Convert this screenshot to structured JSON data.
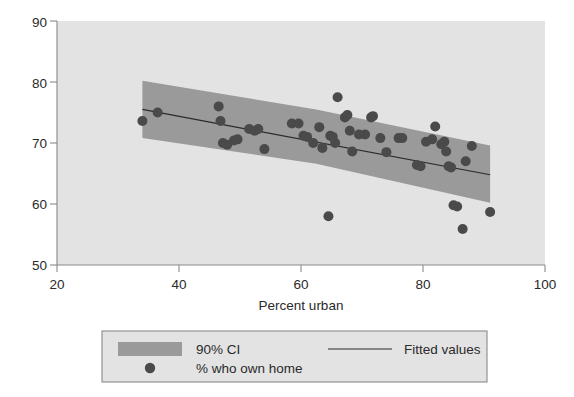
{
  "chart_data": {
    "type": "scatter",
    "title": "",
    "xlabel": "Percent urban",
    "ylabel": "",
    "xlim": [
      20,
      100
    ],
    "ylim": [
      50,
      90
    ],
    "xticks": [
      20,
      40,
      60,
      80,
      100
    ],
    "yticks": [
      50,
      60,
      70,
      80,
      90
    ],
    "grid": false,
    "plot_background": "#e3e3e3",
    "legend_position": "bottom-outside",
    "series": [
      {
        "name": "% who own home",
        "type": "scatter",
        "marker": "circle",
        "color": "#4a4a4a",
        "points": [
          [
            34.0,
            73.6
          ],
          [
            36.5,
            75.0
          ],
          [
            46.5,
            76.0
          ],
          [
            46.8,
            73.6
          ],
          [
            47.2,
            70.0
          ],
          [
            47.9,
            69.7
          ],
          [
            49.0,
            70.4
          ],
          [
            49.6,
            70.6
          ],
          [
            51.5,
            72.3
          ],
          [
            52.4,
            72.0
          ],
          [
            53.0,
            72.3
          ],
          [
            54.0,
            69.0
          ],
          [
            58.5,
            73.2
          ],
          [
            59.6,
            73.2
          ],
          [
            60.4,
            71.2
          ],
          [
            61.0,
            71.0
          ],
          [
            62.0,
            70.0
          ],
          [
            63.0,
            72.6
          ],
          [
            63.5,
            69.2
          ],
          [
            64.5,
            58.0
          ],
          [
            64.8,
            71.2
          ],
          [
            65.2,
            71.0
          ],
          [
            65.6,
            70.0
          ],
          [
            66.0,
            77.5
          ],
          [
            67.2,
            74.2
          ],
          [
            67.6,
            74.6
          ],
          [
            68.0,
            72.0
          ],
          [
            68.4,
            68.6
          ],
          [
            69.5,
            71.4
          ],
          [
            70.5,
            71.4
          ],
          [
            71.5,
            74.2
          ],
          [
            71.8,
            74.4
          ],
          [
            73.0,
            70.8
          ],
          [
            74.0,
            68.5
          ],
          [
            76.0,
            70.8
          ],
          [
            76.6,
            70.8
          ],
          [
            79.0,
            66.4
          ],
          [
            79.6,
            66.2
          ],
          [
            80.5,
            70.2
          ],
          [
            81.5,
            70.6
          ],
          [
            82.0,
            72.7
          ],
          [
            83.0,
            69.8
          ],
          [
            83.5,
            70.2
          ],
          [
            83.8,
            68.6
          ],
          [
            84.2,
            66.2
          ],
          [
            84.6,
            66.0
          ],
          [
            85.0,
            59.8
          ],
          [
            85.6,
            59.6
          ],
          [
            86.5,
            55.9
          ],
          [
            87.0,
            67.0
          ],
          [
            88.0,
            69.5
          ],
          [
            91.0,
            58.7
          ]
        ]
      },
      {
        "name": "Fitted values",
        "type": "line",
        "color": "#2a2a2a",
        "x": [
          34.0,
          91.0
        ],
        "y": [
          75.5,
          64.8
        ]
      },
      {
        "name": "90% CI",
        "type": "band",
        "color": "#9a9a9a",
        "x": [
          34.0,
          62.5,
          91.0
        ],
        "upper": [
          80.2,
          75.5,
          69.6
        ],
        "lower": [
          70.8,
          66.6,
          60.2
        ]
      }
    ]
  },
  "legend": {
    "items": [
      {
        "key": "ci",
        "label": "90% CI",
        "swatch": "band"
      },
      {
        "key": "fitted",
        "label": "Fitted values",
        "swatch": "line"
      },
      {
        "key": "points",
        "label": "% who own home",
        "swatch": "dot"
      }
    ]
  },
  "axes": {
    "x_title": "Percent urban",
    "x_tick_labels": [
      "20",
      "40",
      "60",
      "80",
      "100"
    ],
    "y_tick_labels": [
      "50",
      "60",
      "70",
      "80",
      "90"
    ]
  },
  "colors": {
    "plot_bg": "#e3e3e3",
    "band": "#9a9a9a",
    "marker": "#4a4a4a",
    "line": "#2a2a2a",
    "axis": "#8a8a8a",
    "text": "#2a2a2a",
    "legend_border": "#8a8a8a",
    "page_bg": "#ffffff"
  }
}
